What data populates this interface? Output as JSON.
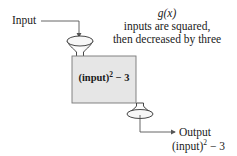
{
  "diagram": {
    "input_label": "Input",
    "function_name": "g(x)",
    "description_line1": "inputs are squared,",
    "description_line2": "then decreased by three",
    "box": {
      "expr_base": "(input)",
      "expr_exp": "2",
      "expr_rest": " − 3",
      "fill": "#e6e6e6"
    },
    "output_label": "Output",
    "output_expr_base": "(input)",
    "output_expr_exp": "2",
    "output_expr_rest": " − 3",
    "icons": [
      "input-funnel-icon",
      "output-funnel-icon",
      "arrow-icon"
    ]
  }
}
